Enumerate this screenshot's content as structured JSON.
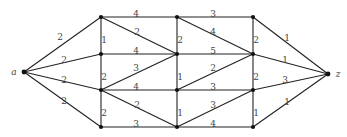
{
  "graph": {
    "nodes": [
      {
        "id": "a",
        "x": 24,
        "y": 72,
        "label": "a"
      },
      {
        "id": "n11",
        "x": 101,
        "y": 17,
        "label": ""
      },
      {
        "id": "n21",
        "x": 101,
        "y": 54,
        "label": ""
      },
      {
        "id": "n31",
        "x": 101,
        "y": 90,
        "label": ""
      },
      {
        "id": "n41",
        "x": 101,
        "y": 127,
        "label": ""
      },
      {
        "id": "n12",
        "x": 177,
        "y": 17,
        "label": ""
      },
      {
        "id": "n22",
        "x": 177,
        "y": 54,
        "label": ""
      },
      {
        "id": "n32",
        "x": 177,
        "y": 90,
        "label": ""
      },
      {
        "id": "n42",
        "x": 177,
        "y": 127,
        "label": ""
      },
      {
        "id": "n13",
        "x": 253,
        "y": 17,
        "label": ""
      },
      {
        "id": "n23",
        "x": 253,
        "y": 54,
        "label": ""
      },
      {
        "id": "n33",
        "x": 253,
        "y": 90,
        "label": ""
      },
      {
        "id": "n43",
        "x": 253,
        "y": 127,
        "label": ""
      },
      {
        "id": "z",
        "x": 328,
        "y": 74,
        "label": "z"
      }
    ],
    "edges": [
      {
        "from": "a",
        "to": "n11",
        "weight": "2",
        "lx": 60,
        "ly": 37
      },
      {
        "from": "a",
        "to": "n21",
        "weight": "2",
        "lx": 64,
        "ly": 60
      },
      {
        "from": "a",
        "to": "n31",
        "weight": "2",
        "lx": 64,
        "ly": 80
      },
      {
        "from": "a",
        "to": "n41",
        "weight": "2",
        "lx": 64,
        "ly": 101
      },
      {
        "from": "n11",
        "to": "n21",
        "weight": "1",
        "lx": 104,
        "ly": 40
      },
      {
        "from": "n21",
        "to": "n31",
        "weight": "2",
        "lx": 104,
        "ly": 77
      },
      {
        "from": "n31",
        "to": "n41",
        "weight": "2",
        "lx": 104,
        "ly": 113
      },
      {
        "from": "n11",
        "to": "n12",
        "weight": "4",
        "lx": 136,
        "ly": 14
      },
      {
        "from": "n21",
        "to": "n22",
        "weight": "4",
        "lx": 136,
        "ly": 51
      },
      {
        "from": "n31",
        "to": "n32",
        "weight": "4",
        "lx": 136,
        "ly": 87
      },
      {
        "from": "n41",
        "to": "n42",
        "weight": "3",
        "lx": 136,
        "ly": 124
      },
      {
        "from": "n11",
        "to": "n22",
        "weight": "2",
        "lx": 137,
        "ly": 32
      },
      {
        "from": "n31",
        "to": "n22",
        "weight": "3",
        "lx": 136,
        "ly": 68
      },
      {
        "from": "n31",
        "to": "n42",
        "weight": "2",
        "lx": 137,
        "ly": 105
      },
      {
        "from": "n12",
        "to": "n22",
        "weight": "2",
        "lx": 180,
        "ly": 40
      },
      {
        "from": "n22",
        "to": "n32",
        "weight": "1",
        "lx": 180,
        "ly": 77
      },
      {
        "from": "n32",
        "to": "n42",
        "weight": "1",
        "lx": 180,
        "ly": 113
      },
      {
        "from": "n12",
        "to": "n13",
        "weight": "3",
        "lx": 213,
        "ly": 14
      },
      {
        "from": "n22",
        "to": "n23",
        "weight": "5",
        "lx": 213,
        "ly": 51
      },
      {
        "from": "n32",
        "to": "n33",
        "weight": "3",
        "lx": 213,
        "ly": 87
      },
      {
        "from": "n42",
        "to": "n43",
        "weight": "4",
        "lx": 213,
        "ly": 124
      },
      {
        "from": "n12",
        "to": "n23",
        "weight": "4",
        "lx": 213,
        "ly": 32
      },
      {
        "from": "n32",
        "to": "n23",
        "weight": "2",
        "lx": 213,
        "ly": 68
      },
      {
        "from": "n42",
        "to": "n33",
        "weight": "3",
        "lx": 213,
        "ly": 105
      },
      {
        "from": "n13",
        "to": "n23",
        "weight": "2",
        "lx": 256,
        "ly": 40
      },
      {
        "from": "n23",
        "to": "n33",
        "weight": "2",
        "lx": 256,
        "ly": 77
      },
      {
        "from": "n33",
        "to": "n43",
        "weight": "1",
        "lx": 256,
        "ly": 113
      },
      {
        "from": "n13",
        "to": "z",
        "weight": "1",
        "lx": 287,
        "ly": 38
      },
      {
        "from": "n23",
        "to": "z",
        "weight": "1",
        "lx": 285,
        "ly": 60
      },
      {
        "from": "n33",
        "to": "z",
        "weight": "3",
        "lx": 285,
        "ly": 80
      },
      {
        "from": "n43",
        "to": "z",
        "weight": "1",
        "lx": 287,
        "ly": 102
      }
    ]
  }
}
